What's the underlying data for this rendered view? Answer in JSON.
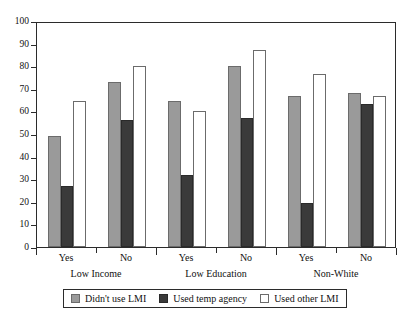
{
  "chart_data": {
    "type": "bar",
    "title": "",
    "subtitle": "",
    "xlabel": "",
    "ylabel": "",
    "ylim": [
      0,
      100
    ],
    "ytick_step": 10,
    "yticks": [
      0,
      10,
      20,
      30,
      40,
      50,
      60,
      70,
      80,
      90,
      100
    ],
    "grid": false,
    "legend_position": "bottom",
    "categories": [
      "Yes",
      "No",
      "Yes",
      "No",
      "Yes",
      "No"
    ],
    "groups": [
      {
        "name": "Low Income",
        "categories": [
          "Yes",
          "No"
        ]
      },
      {
        "name": "Low Education",
        "categories": [
          "Yes",
          "No"
        ]
      },
      {
        "name": "Non-White",
        "categories": [
          "Yes",
          "No"
        ]
      }
    ],
    "series": [
      {
        "name": "Didn't use LMI",
        "color": "#9a9a9a",
        "values": [
          49,
          73,
          64.5,
          80,
          67,
          68
        ]
      },
      {
        "name": "Used temp agency",
        "color": "#3a3a3a",
        "values": [
          27,
          56,
          32,
          57,
          19.5,
          63.5
        ]
      },
      {
        "name": "Used other LMI",
        "color": "#ffffff",
        "values": [
          64.5,
          80,
          60,
          87,
          76.5,
          67
        ]
      }
    ]
  },
  "legend": {
    "items": [
      {
        "label": "Didn't use LMI"
      },
      {
        "label": "Used temp agency"
      },
      {
        "label": "Used other LMI"
      }
    ]
  }
}
